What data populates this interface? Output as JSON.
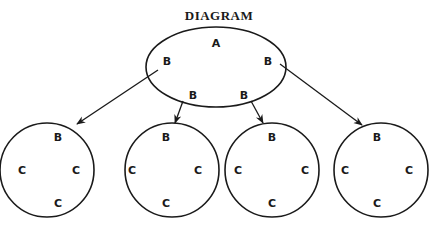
{
  "title": "DIAGRAM",
  "parent": {
    "shape": "ellipse",
    "cx": 216,
    "cy": 67,
    "rx": 70,
    "ry": 40,
    "labels": [
      {
        "text": "A",
        "x": 216,
        "y": 43
      },
      {
        "text": "B",
        "x": 167,
        "y": 61
      },
      {
        "text": "B",
        "x": 268,
        "y": 61
      },
      {
        "text": "B",
        "x": 193,
        "y": 95
      },
      {
        "text": "B",
        "x": 244,
        "y": 95
      }
    ]
  },
  "children": [
    {
      "cx": 47,
      "cy": 170,
      "r": 47,
      "labels": [
        {
          "text": "B",
          "dx": 11,
          "dy": -33
        },
        {
          "text": "C",
          "dx": -25,
          "dy": 0
        },
        {
          "text": "C",
          "dx": 29,
          "dy": 0
        },
        {
          "text": "C",
          "dx": 11,
          "dy": 33
        }
      ]
    },
    {
      "cx": 172,
      "cy": 170,
      "r": 47,
      "labels": [
        {
          "text": "B",
          "dx": -6,
          "dy": -33
        },
        {
          "text": "C",
          "dx": -40,
          "dy": 0
        },
        {
          "text": "C",
          "dx": 26,
          "dy": 0
        },
        {
          "text": "C",
          "dx": -6,
          "dy": 33
        }
      ]
    },
    {
      "cx": 272,
      "cy": 170,
      "r": 47,
      "labels": [
        {
          "text": "B",
          "dx": 0,
          "dy": -33
        },
        {
          "text": "C",
          "dx": -34,
          "dy": 0
        },
        {
          "text": "C",
          "dx": 33,
          "dy": 0
        },
        {
          "text": "C",
          "dx": 0,
          "dy": 33
        }
      ]
    },
    {
      "cx": 381,
      "cy": 170,
      "r": 47,
      "labels": [
        {
          "text": "B",
          "dx": -4,
          "dy": -33
        },
        {
          "text": "C",
          "dx": -36,
          "dy": 0
        },
        {
          "text": "C",
          "dx": 28,
          "dy": 0
        },
        {
          "text": "C",
          "dx": -4,
          "dy": 33
        }
      ]
    }
  ],
  "arrows": [
    {
      "from": [
        158,
        70
      ],
      "to": [
        77,
        124
      ]
    },
    {
      "from": [
        183,
        101
      ],
      "to": [
        175,
        123
      ]
    },
    {
      "from": [
        251,
        101
      ],
      "to": [
        263,
        123
      ]
    },
    {
      "from": [
        280,
        64
      ],
      "to": [
        362,
        125
      ]
    }
  ],
  "colors": {
    "stroke": "#1a1a1a",
    "background": "#ffffff"
  }
}
